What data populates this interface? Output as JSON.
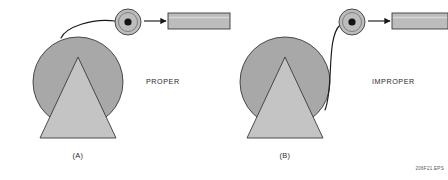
{
  "figure": {
    "code_label": "206F21.EPS",
    "background": "#ffffff",
    "outline_color": "#3a3a3a",
    "spool_fill": "#a8a8a8",
    "cone_fill": "#c4c4c4",
    "roller_fill": "#bdbdbd",
    "roller_hub_fill": "#141414",
    "tube_fill": "#bcbcbc",
    "wire_color": "#1a1a1a",
    "text_color": "#2b2b2b"
  },
  "panels": [
    {
      "id": "panel-a",
      "panel_label": "(A)",
      "verdict_label": "PROPER",
      "verdict_kind": "proper",
      "spool": {
        "cx": 78,
        "cy": 82,
        "r": 45
      },
      "cone": {
        "apex_x": 78,
        "apex_y": 57,
        "base_y": 138,
        "base_left_x": 40,
        "base_right_x": 116,
        "top_left_x": 69,
        "top_right_x": 87
      },
      "roller": {
        "cx": 128,
        "cy": 22,
        "r": 13,
        "ring_r": 9.5,
        "hub_r": 3.6
      },
      "tube": {
        "x": 168,
        "y": 13,
        "w": 62,
        "h": 16
      },
      "wire_origin": {
        "x": 61,
        "y": 38
      },
      "feed_arrow_from_x": 144,
      "feed_arrow_to_x": 166,
      "verdict_x": 146,
      "verdict_y": 84,
      "panel_label_x": 78,
      "panel_label_y": 158
    },
    {
      "id": "panel-b",
      "panel_label": "(B)",
      "verdict_label": "IMPROPER",
      "verdict_kind": "improper",
      "spool": {
        "cx": 285,
        "cy": 82,
        "r": 45
      },
      "cone": {
        "apex_x": 285,
        "apex_y": 57,
        "base_y": 138,
        "base_left_x": 247,
        "base_right_x": 323,
        "top_left_x": 276,
        "top_right_x": 294
      },
      "roller": {
        "cx": 352,
        "cy": 22,
        "r": 13,
        "ring_r": 9.5,
        "hub_r": 3.6
      },
      "tube": {
        "x": 392,
        "y": 13,
        "w": 56,
        "h": 16
      },
      "wire_origin": {
        "x": 325,
        "y": 110
      },
      "feed_arrow_from_x": 368,
      "feed_arrow_to_x": 390,
      "verdict_x": 372,
      "verdict_y": 84,
      "panel_label_x": 285,
      "panel_label_y": 158
    }
  ]
}
